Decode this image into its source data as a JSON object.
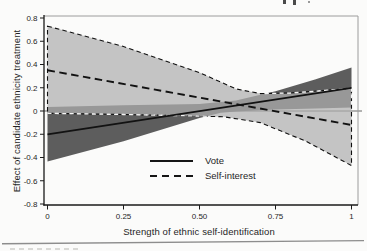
{
  "chart_data": {
    "type": "line",
    "title": "",
    "xlabel": "Strength of ethnic self-identification",
    "ylabel": "Effect of candidate ethnicity treatment",
    "xlim": [
      0,
      1
    ],
    "ylim": [
      -0.8,
      0.8
    ],
    "grid": false,
    "zero_line": true,
    "x_ticks": [
      {
        "v": 0,
        "label": "0"
      },
      {
        "v": 0.25,
        "label": "0.25"
      },
      {
        "v": 0.5,
        "label": "0.50"
      },
      {
        "v": 0.75,
        "label": "0.75"
      },
      {
        "v": 1,
        "label": "1"
      }
    ],
    "y_ticks": [
      {
        "v": 0.8,
        "label": "0.8"
      },
      {
        "v": 0.6,
        "label": "0.6"
      },
      {
        "v": 0.4,
        "label": "0.4"
      },
      {
        "v": 0.2,
        "label": "0.2"
      },
      {
        "v": 0,
        "label": "0"
      },
      {
        "v": -0.2,
        "label": "-0.2"
      },
      {
        "v": -0.4,
        "label": "-0.4"
      },
      {
        "v": -0.6,
        "label": "-0.6"
      },
      {
        "v": -0.8,
        "label": "-0.8"
      }
    ],
    "legend": {
      "position": "inside-bottom-center",
      "entries": [
        {
          "label": "Vote",
          "line_style": "solid"
        },
        {
          "label": "Self-interest",
          "line_style": "dashed"
        }
      ]
    },
    "series": [
      {
        "name": "Vote",
        "line_style": "solid",
        "line": [
          [
            0,
            -0.2
          ],
          [
            1,
            0.2
          ]
        ],
        "ci_upper": [
          [
            0,
            0.035
          ],
          [
            0.25,
            0.05
          ],
          [
            0.5,
            0.06
          ],
          [
            0.62,
            0.09
          ],
          [
            0.75,
            0.17
          ],
          [
            0.88,
            0.27
          ],
          [
            1,
            0.375
          ]
        ],
        "ci_lower": [
          [
            0,
            -0.435
          ],
          [
            0.25,
            -0.26
          ],
          [
            0.5,
            -0.06
          ],
          [
            0.57,
            -0.015
          ],
          [
            0.62,
            -0.005
          ],
          [
            0.75,
            0.012
          ],
          [
            0.88,
            0.022
          ],
          [
            1,
            0.03
          ]
        ]
      },
      {
        "name": "Self-interest",
        "line_style": "dashed",
        "line": [
          [
            0,
            0.35
          ],
          [
            1,
            -0.12
          ]
        ],
        "ci_upper": [
          [
            0,
            0.73
          ],
          [
            0.25,
            0.555
          ],
          [
            0.5,
            0.33
          ],
          [
            0.62,
            0.19
          ],
          [
            0.7,
            0.15
          ],
          [
            0.8,
            0.155
          ],
          [
            0.9,
            0.175
          ],
          [
            1,
            0.195
          ]
        ],
        "ci_lower": [
          [
            0,
            -0.02
          ],
          [
            0.25,
            -0.03
          ],
          [
            0.45,
            -0.04
          ],
          [
            0.58,
            -0.05
          ],
          [
            0.7,
            -0.1
          ],
          [
            0.85,
            -0.26
          ],
          [
            1,
            -0.47
          ]
        ]
      }
    ],
    "style": {
      "background": "#fbfbfa",
      "band_dark": "#5d5d5d",
      "band_light_fill": "rgba(174,174,174,0.72)",
      "band_light_solid": "#c5c5c5",
      "line_color": "#121212",
      "axis_color": "#1a1a1a",
      "frame_gray": "#9c9c9c",
      "white_dash": "#f5f5f5",
      "rule_color": "#8d8d8d",
      "text_color": "#1f1f1f"
    }
  }
}
